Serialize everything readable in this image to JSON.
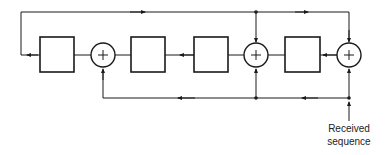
{
  "diagram": {
    "type": "block-diagram",
    "blocks": [
      {
        "id": "stage-1",
        "kind": "register"
      },
      {
        "id": "adder-1",
        "kind": "xor",
        "symbol": "+"
      },
      {
        "id": "stage-2",
        "kind": "register"
      },
      {
        "id": "stage-3",
        "kind": "register"
      },
      {
        "id": "adder-2",
        "kind": "xor",
        "symbol": "+"
      },
      {
        "id": "stage-4",
        "kind": "register"
      },
      {
        "id": "adder-3",
        "kind": "xor",
        "symbol": "+"
      }
    ],
    "input_label_line1": "Received",
    "input_label_line2": "sequence",
    "line_color": "#1a1a1a",
    "background": "#ffffff"
  }
}
